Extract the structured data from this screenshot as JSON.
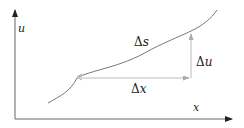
{
  "diagram": {
    "axes": {
      "x_label": "x",
      "y_label": "u"
    },
    "labels": {
      "delta_s": {
        "symbol": "Δ",
        "var": "s"
      },
      "delta_u": {
        "symbol": "Δ",
        "var": "u"
      },
      "delta_x": {
        "symbol": "Δ",
        "var": "x"
      }
    },
    "colors": {
      "axis": "#555555",
      "curve": "#777777",
      "arrows": "#bbbbbb",
      "text": "#222222"
    }
  }
}
